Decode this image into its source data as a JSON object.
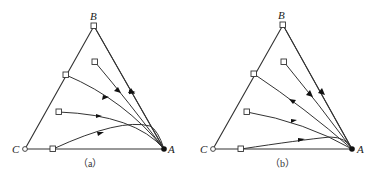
{
  "figure": {
    "panels": [
      {
        "id": "a",
        "caption": "（a）",
        "vertices": {
          "A": {
            "label": "A",
            "marker": "solid-dot"
          },
          "B": {
            "label": "B",
            "marker": "open-square"
          },
          "C": {
            "label": "C",
            "marker": "open-circle"
          }
        },
        "curves": 5,
        "start_markers": "open-square",
        "end_point": "A"
      },
      {
        "id": "b",
        "caption": "（b）",
        "vertices": {
          "A": {
            "label": "A",
            "marker": "solid-dot"
          },
          "B": {
            "label": "B",
            "marker": "open-square"
          },
          "C": {
            "label": "C",
            "marker": "open-circle"
          }
        },
        "curves": 5,
        "start_markers": "open-square",
        "end_point": "A"
      }
    ]
  }
}
